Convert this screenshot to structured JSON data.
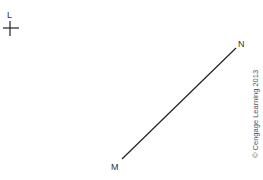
{
  "diagram": {
    "point_label_L": "L",
    "segment": {
      "start_label": "M",
      "end_label": "N"
    },
    "copyright": "© Cengage Learning 2013",
    "colors": {
      "line": "#222222",
      "text": "#333333",
      "copyright": "#555555"
    }
  }
}
